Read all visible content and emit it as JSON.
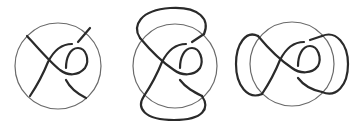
{
  "figure": {
    "panels": [
      {
        "id": "panel-1",
        "description": "tangle in disk",
        "circle": {
          "cx": 58,
          "cy": 66,
          "r": 43
        }
      },
      {
        "id": "panel-2",
        "description": "tangle closed with vertical arcs",
        "circle": {
          "cx": 175,
          "cy": 64,
          "r": 43
        }
      },
      {
        "id": "panel-3",
        "description": "tangle closed with horizontal arcs",
        "circle": {
          "cx": 292,
          "cy": 64,
          "r": 43
        }
      }
    ],
    "colors": {
      "strand": "#2a2a2a",
      "circle": "#6a6a6a",
      "background": "#ffffff"
    }
  }
}
